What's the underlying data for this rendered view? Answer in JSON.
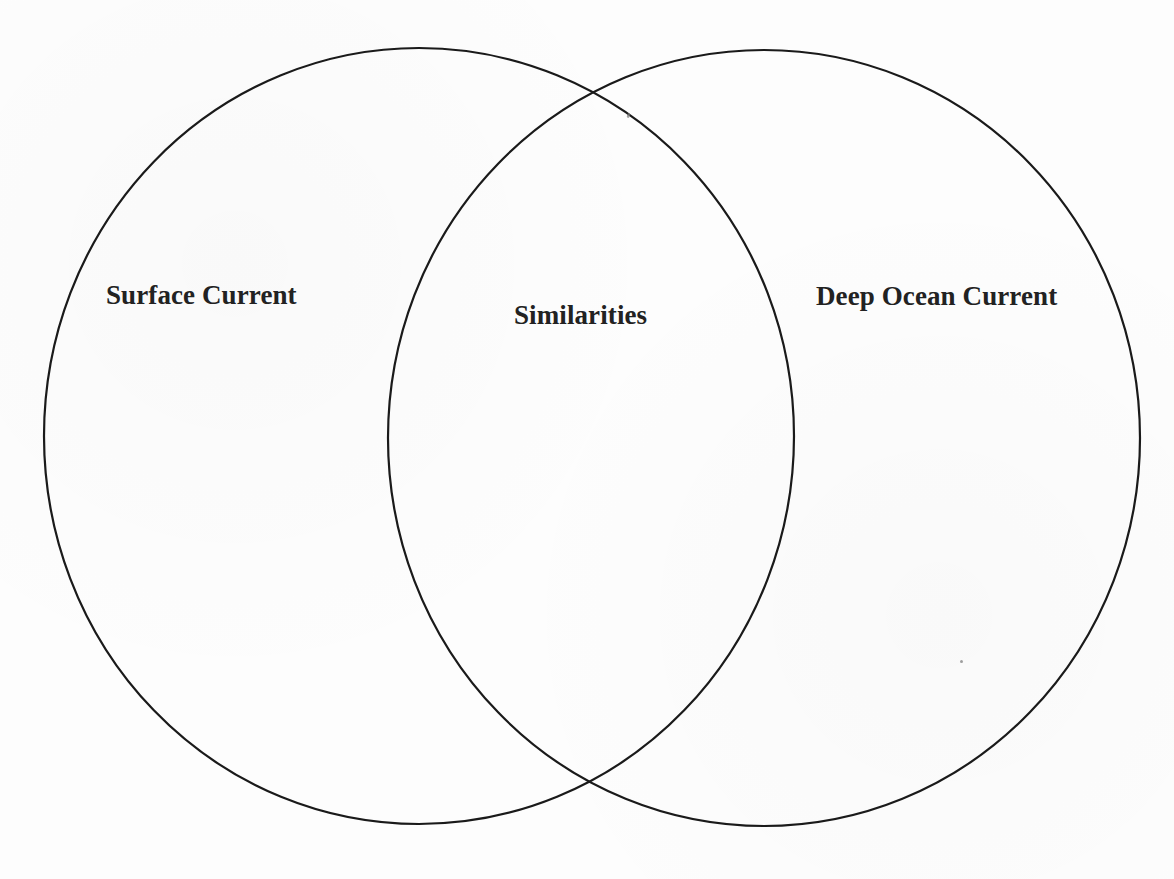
{
  "diagram": {
    "type": "venn",
    "sets": [
      {
        "id": "left",
        "label": "Surface Current"
      },
      {
        "id": "right",
        "label": "Deep Ocean Current"
      }
    ],
    "intersection": {
      "label": "Similarities"
    },
    "colors": {
      "stroke": "#1a1a1a",
      "text": "#222222",
      "background": "#fdfdfd"
    }
  }
}
